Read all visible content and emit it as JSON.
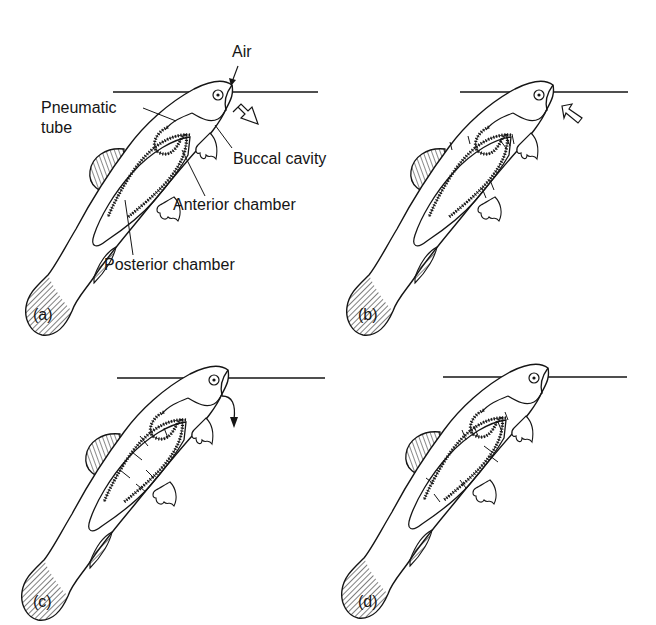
{
  "figure": {
    "ink_color": "#151515",
    "background": "#ffffff"
  },
  "labels": {
    "air": "Air",
    "pneumatic_tube_line1": "Pneumatic",
    "pneumatic_tube_line2": "tube",
    "buccal_cavity": "Buccal cavity",
    "anterior_chamber": "Anterior chamber",
    "posterior_chamber": "Posterior chamber"
  },
  "panels": [
    {
      "id": "a",
      "label": "(a)",
      "arrow": "outward hollow arrow at mouth"
    },
    {
      "id": "b",
      "label": "(b)",
      "arrow": "inward hollow arrow at mouth"
    },
    {
      "id": "c",
      "label": "(c)",
      "arrow": "curved arrow downward from mouth"
    },
    {
      "id": "d",
      "label": "(d)",
      "arrow": "none"
    }
  ]
}
